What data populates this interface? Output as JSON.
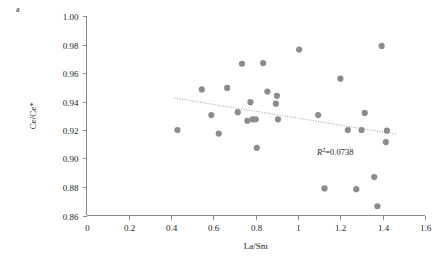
{
  "figure": {
    "panel_label": "a"
  },
  "chart_data": {
    "type": "scatter",
    "title": "",
    "xlabel": "La/Sm",
    "ylabel": "Ce/Ce*",
    "xlim": [
      0,
      1.6
    ],
    "ylim": [
      0.86,
      1.0
    ],
    "grid": false,
    "legend": null,
    "x_ticks": [
      0,
      0.2,
      0.4,
      0.6,
      0.8,
      1,
      1.2,
      1.4,
      1.6
    ],
    "x_tick_labels": [
      "0",
      "0.2",
      "0.4",
      "0.6",
      "0.8",
      "1",
      "1.2",
      "1.4",
      "1.6"
    ],
    "y_ticks": [
      0.86,
      0.88,
      0.9,
      0.92,
      0.94,
      0.96,
      0.98,
      1.0
    ],
    "y_tick_labels": [
      "0.86",
      "0.88",
      "0.90",
      "0.92",
      "0.94",
      "0.96",
      "0.98",
      "1.00"
    ],
    "marker": "filled-circle",
    "marker_color": "#8c8c8c",
    "points": [
      {
        "x": 0.43,
        "y": 0.92
      },
      {
        "x": 0.545,
        "y": 0.9485
      },
      {
        "x": 0.59,
        "y": 0.9305
      },
      {
        "x": 0.625,
        "y": 0.9175
      },
      {
        "x": 0.665,
        "y": 0.9495
      },
      {
        "x": 0.715,
        "y": 0.9325
      },
      {
        "x": 0.735,
        "y": 0.9665
      },
      {
        "x": 0.76,
        "y": 0.9265
      },
      {
        "x": 0.775,
        "y": 0.9395
      },
      {
        "x": 0.805,
        "y": 0.9075
      },
      {
        "x": 0.835,
        "y": 0.967
      },
      {
        "x": 0.855,
        "y": 0.947
      },
      {
        "x": 0.895,
        "y": 0.9385
      },
      {
        "x": 0.905,
        "y": 0.9275
      },
      {
        "x": 0.785,
        "y": 0.9275
      },
      {
        "x": 0.8,
        "y": 0.9275
      },
      {
        "x": 1.005,
        "y": 0.9765
      },
      {
        "x": 1.095,
        "y": 0.9305
      },
      {
        "x": 1.125,
        "y": 0.879
      },
      {
        "x": 1.2,
        "y": 0.956
      },
      {
        "x": 1.275,
        "y": 0.8785
      },
      {
        "x": 1.315,
        "y": 0.932
      },
      {
        "x": 1.235,
        "y": 0.92
      },
      {
        "x": 1.3,
        "y": 0.92
      },
      {
        "x": 1.36,
        "y": 0.887
      },
      {
        "x": 1.395,
        "y": 0.979
      },
      {
        "x": 1.42,
        "y": 0.9195
      },
      {
        "x": 1.415,
        "y": 0.9115
      },
      {
        "x": 1.375,
        "y": 0.8665
      },
      {
        "x": 0.9,
        "y": 0.944
      }
    ],
    "trendline": {
      "style": "dotted",
      "color": "#9a9a9a",
      "x_start": 0.415,
      "y_start": 0.9425,
      "x_end": 1.465,
      "y_end": 0.917
    },
    "annotations": [
      {
        "name": "r-squared",
        "prefix": "R",
        "superscript": "2",
        "suffix": "=0.0738",
        "x": 1.09,
        "y": 0.9025
      }
    ]
  }
}
